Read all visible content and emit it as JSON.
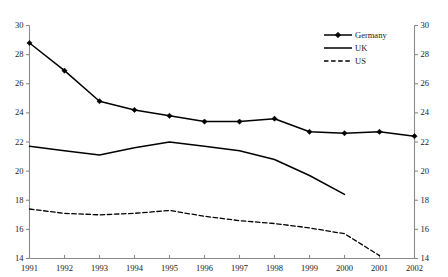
{
  "chart_data": {
    "type": "line",
    "title": "",
    "subtitle": "",
    "xlabel": "",
    "ylabel": "",
    "x": [
      1991,
      1992,
      1993,
      1994,
      1995,
      1996,
      1997,
      1998,
      1999,
      2000,
      2001,
      2002
    ],
    "xticklabels": [
      "1991",
      "1992",
      "1993",
      "1994",
      "1995",
      "1996",
      "1997",
      "1998",
      "1999",
      "2000",
      "2001",
      "2002"
    ],
    "xlim": [
      1991,
      2002
    ],
    "ylim": [
      14,
      30
    ],
    "yticks": [
      14,
      16,
      18,
      20,
      22,
      24,
      26,
      28,
      30
    ],
    "yticklabels": [
      "14",
      "16",
      "18",
      "20",
      "22",
      "24",
      "26",
      "28",
      "30"
    ],
    "y_axis_left": true,
    "y_axis_right": true,
    "yticklabels_right": [
      "14",
      "16",
      "18",
      "20",
      "22",
      "24",
      "26",
      "28",
      "30"
    ],
    "grid": false,
    "legend_position": "top-right",
    "series": [
      {
        "name": "Germany",
        "style": "solid-with-diamond-markers",
        "color": "#000000",
        "x": [
          1991,
          1992,
          1993,
          1994,
          1995,
          1996,
          1997,
          1998,
          1999,
          2000,
          2001,
          2002
        ],
        "values": [
          28.8,
          26.9,
          24.8,
          24.2,
          23.8,
          23.4,
          23.4,
          23.6,
          22.7,
          22.6,
          22.7,
          22.4
        ]
      },
      {
        "name": "UK",
        "style": "solid",
        "color": "#000000",
        "x": [
          1991,
          1992,
          1993,
          1994,
          1995,
          1996,
          1997,
          1998,
          1999,
          2000
        ],
        "values": [
          21.7,
          21.4,
          21.1,
          21.6,
          22.0,
          21.7,
          21.4,
          20.8,
          19.7,
          18.4
        ]
      },
      {
        "name": "US",
        "style": "dashed",
        "color": "#000000",
        "x": [
          1991,
          1992,
          1993,
          1994,
          1995,
          1996,
          1997,
          1998,
          1999,
          2000,
          2001
        ],
        "values": [
          17.4,
          17.1,
          17.0,
          17.1,
          17.3,
          16.9,
          16.6,
          16.4,
          16.1,
          15.7,
          14.2
        ]
      }
    ]
  },
  "legend": {
    "items": [
      {
        "label": "Germany",
        "marker": "diamond-marker-icon",
        "line": "solid"
      },
      {
        "label": "UK",
        "marker": "none",
        "line": "solid"
      },
      {
        "label": "US",
        "marker": "none",
        "line": "dashed"
      }
    ]
  }
}
